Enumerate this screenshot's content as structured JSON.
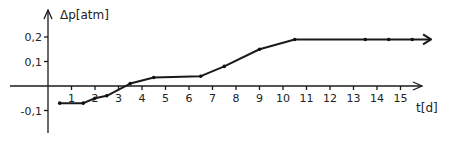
{
  "chart_data": {
    "type": "line",
    "title": "",
    "xlabel": "t[d]",
    "ylabel": "Δp[atm]",
    "xlim": [
      0,
      16
    ],
    "ylim": [
      -0.15,
      0.25
    ],
    "x_ticks": [
      1,
      2,
      3,
      4,
      5,
      6,
      7,
      8,
      9,
      10,
      11,
      12,
      13,
      14,
      15
    ],
    "y_ticks": [
      {
        "value": 0.2,
        "label": "0,2"
      },
      {
        "value": 0.1,
        "label": "0,1"
      },
      {
        "value": -0.1,
        "label": "-0,1"
      }
    ],
    "grid": false,
    "legend": null,
    "series": [
      {
        "name": "Δp",
        "x": [
          0.5,
          1.5,
          2.0,
          2.5,
          3.5,
          4.5,
          6.5,
          7.5,
          9.0,
          10.5,
          13.5,
          14.5,
          15.5,
          16.3
        ],
        "y": [
          -0.07,
          -0.07,
          -0.05,
          -0.04,
          0.01,
          0.035,
          0.04,
          0.08,
          0.15,
          0.19,
          0.19,
          0.19,
          0.19,
          0.19
        ],
        "markers": [
          true,
          true,
          true,
          true,
          true,
          true,
          true,
          true,
          true,
          true,
          true,
          true,
          true,
          false
        ],
        "end_arrow": true
      }
    ]
  }
}
